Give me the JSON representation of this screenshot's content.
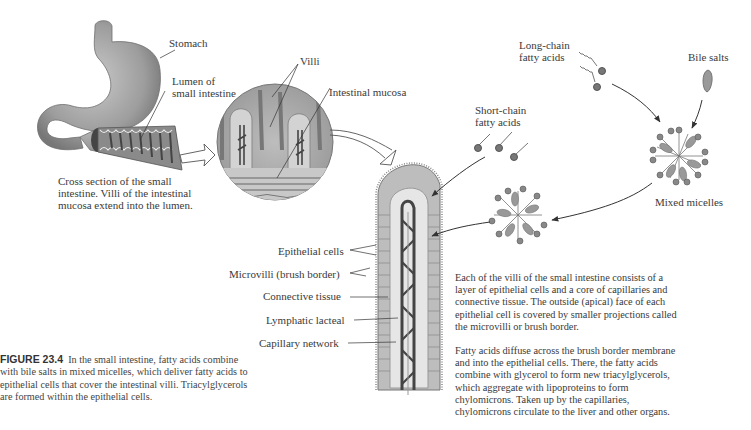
{
  "figure": {
    "number": "FIGURE 23.4",
    "caption": "In the small intestine, fatty acids combine with bile salts in mixed micelles, which deliver fatty acids to epithelial cells that cover the intestinal villi. Triacylglycerols are formed within the epithelial cells."
  },
  "labels": {
    "stomach": "Stomach",
    "lumen_line1": "Lumen of",
    "lumen_line2": "small intestine",
    "villi": "Villi",
    "mucosa": "Intestinal mucosa",
    "cross_section": [
      "Cross section of the small",
      "intestine. Villi of the intestinal",
      "mucosa extend into the lumen."
    ],
    "long_chain": [
      "Long-chain",
      "fatty acids"
    ],
    "short_chain": [
      "Short-chain",
      "fatty acids"
    ],
    "bile_salts": "Bile salts",
    "mixed_micelles": "Mixed micelles",
    "villus_parts": [
      "Epithelial cells",
      "Microvilli (brush border)",
      "Connective tissue",
      "Lymphatic lacteal",
      "Capillary network"
    ]
  },
  "paragraphs": [
    [
      "Each of the villi of the small intestine consists of a",
      "layer of epithelial cells and a core of capillaries and",
      "connective tissue. The outside (apical) face of each",
      "epithelial cell is covered by smaller projections called",
      "the microvilli or brush border."
    ],
    [
      "Fatty acids diffuse across the brush border membrane",
      "and into the epithelial cells. There, the fatty acids",
      "combine with glycerol to form new triacylglycerols,",
      "which aggregate with lipoproteins to form",
      "chylomicrons. Taken up by the capillaries,",
      "chylomicrons circulate to the liver and other organs."
    ]
  ],
  "colors": {
    "organ_gray": "#9a9a9a",
    "dark_gray": "#555555",
    "cell_fill": "#b5b5b5",
    "text": "#3a3a3a"
  }
}
